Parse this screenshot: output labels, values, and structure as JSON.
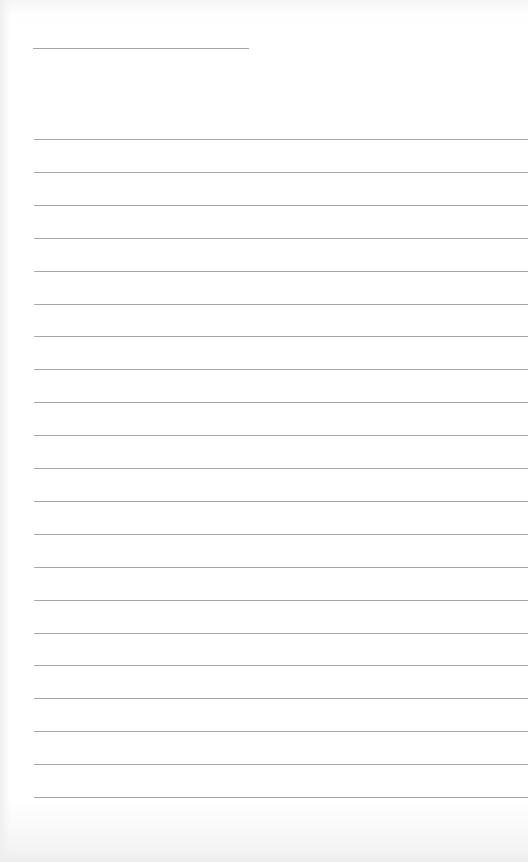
{
  "page": {
    "type": "lined-paper",
    "background_color": "#ffffff",
    "line_color": "#a6a6a6",
    "header_line": {
      "left": 33,
      "top": 48,
      "width": 216
    },
    "rules": {
      "count": 21,
      "left": 34,
      "first_top": 139,
      "spacing": 32.9,
      "right": 528
    }
  }
}
